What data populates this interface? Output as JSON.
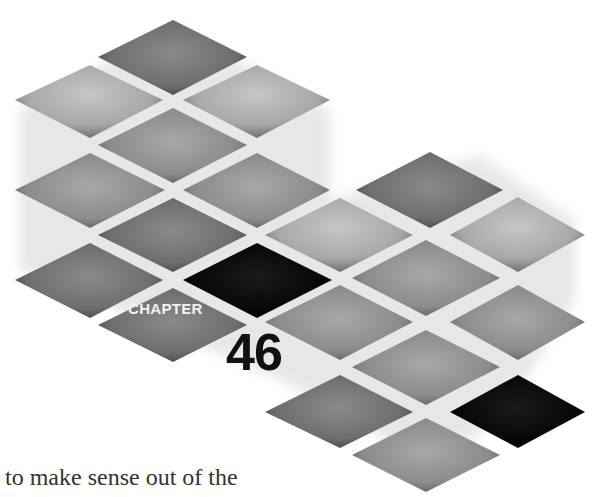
{
  "chapter": {
    "label": "CHAPTER",
    "number": "46"
  },
  "body": {
    "line1": "to make sense out of the",
    "line2": "Th"
  },
  "colors": {
    "background": "#ffffff",
    "tile_light": "#b8b8b8",
    "tile_mid": "#8a8a8a",
    "tile_dark": "#6a6a6a",
    "tile_black": "#0a0a0a",
    "number_color": "#111111",
    "label_color": "#f2f2f2"
  }
}
